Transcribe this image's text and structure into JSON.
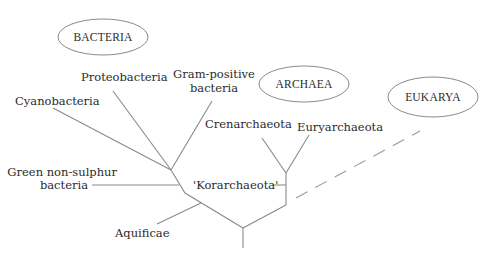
{
  "diagram": {
    "type": "phylogenetic-tree",
    "domains": [
      {
        "label": "BACTERIA"
      },
      {
        "label": "ARCHAEA"
      },
      {
        "label": "EUKARYA"
      }
    ],
    "bacteria": {
      "cyanobacteria": "Cyanobacteria",
      "proteobacteria": "Proteobacteria",
      "gram_positive_line1": "Gram-positive",
      "gram_positive_line2": "bacteria",
      "green_non_sulphur_line1": "Green non-sulphur",
      "green_non_sulphur_line2": "bacteria",
      "aquificae": "Aquificae"
    },
    "archaea": {
      "crenarchaeota": "Crenarchaeota",
      "euryarchaeota": "Euryarchaeota",
      "korarchaeota": "'Korarchaeota'"
    },
    "colors": {
      "line": "#8a8a8a",
      "text": "#2b2b2b",
      "background": "#ffffff"
    }
  }
}
